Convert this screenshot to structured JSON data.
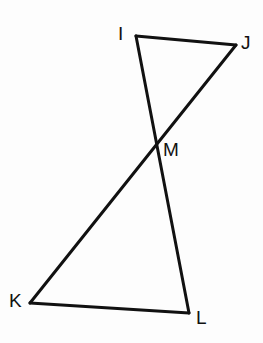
{
  "figure": {
    "background_color": "#fdfdfd",
    "stroke_color": "#111111",
    "stroke_width": 3,
    "width": 263,
    "height": 343,
    "points": {
      "I": {
        "label": "I",
        "x": 136,
        "y": 36
      },
      "J": {
        "label": "J",
        "x": 236,
        "y": 45
      },
      "M": {
        "label": "M",
        "x": 152,
        "y": 141
      },
      "K": {
        "label": "K",
        "x": 30,
        "y": 303
      },
      "L": {
        "label": "L",
        "x": 189,
        "y": 313
      }
    },
    "segments": [
      {
        "name": "segment-IJ",
        "from": "I",
        "to": "J",
        "path": "M 136 36 L 236 45"
      },
      {
        "name": "segment-IL",
        "from": "I",
        "to": "L",
        "path": "M 136 36 L 189 313"
      },
      {
        "name": "segment-JK",
        "from": "J",
        "to": "K",
        "path": "M 236 45 L 30 303"
      },
      {
        "name": "segment-KL",
        "from": "K",
        "to": "L",
        "path": "M 30 303 L 189 313"
      }
    ],
    "triangles": [
      {
        "name": "triangle-IJM",
        "vertices": [
          "I",
          "J",
          "M"
        ]
      },
      {
        "name": "triangle-KLM",
        "vertices": [
          "K",
          "L",
          "M"
        ]
      }
    ]
  }
}
